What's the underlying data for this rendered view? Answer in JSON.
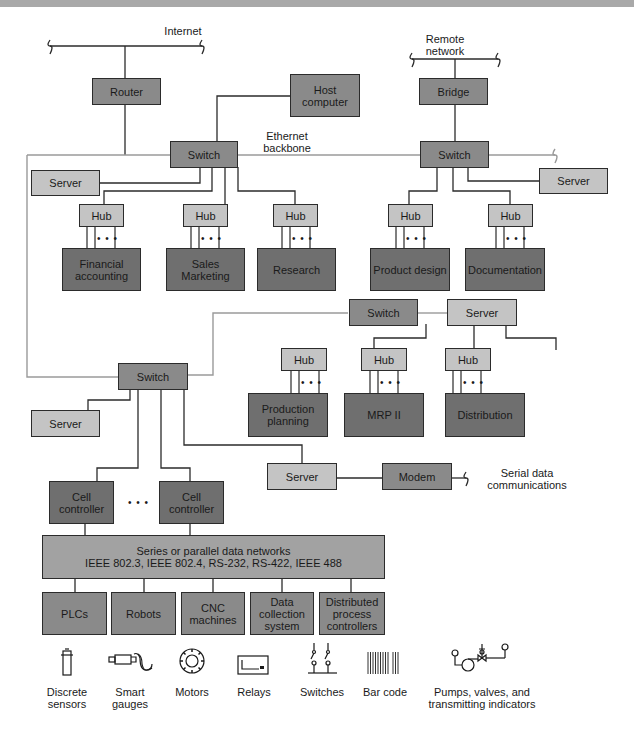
{
  "diagram": {
    "type": "network-topology",
    "external_labels": {
      "internet": "Internet",
      "remote_network": "Remote network",
      "ethernet_backbone": "Ethernet backbone",
      "serial_data": "Serial data communications"
    },
    "nodes": {
      "router": "Router",
      "host_computer": "Host computer",
      "bridge": "Bridge",
      "switch_main": "Switch",
      "switch_right": "Switch",
      "switch_mid": "Switch",
      "switch_factory": "Switch",
      "server_left_top": "Server",
      "server_right_top": "Server",
      "server_mid": "Server",
      "server_factory_left": "Server",
      "server_factory_modem": "Server",
      "modem": "Modem",
      "hub": "Hub",
      "financial_accounting": "Financial accounting",
      "sales_marketing": "Sales Marketing",
      "research": "Research",
      "product_design": "Product design",
      "documentation": "Documentation",
      "production_planning": "Production planning",
      "mrp_ii": "MRP II",
      "distribution": "Distribution",
      "cell_controller": "Cell controller",
      "ellipsis": "• • •",
      "data_networks_line1": "Series or parallel data networks",
      "data_networks_line2": "IEEE 802.3, IEEE 802.4, RS-232, RS-422, IEEE 488",
      "plcs": "PLCs",
      "robots": "Robots",
      "cnc_machines": "CNC machines",
      "data_collection": "Data collection system",
      "distributed_controllers": "Distributed process controllers"
    },
    "devices": [
      {
        "label": "Discrete sensors",
        "icon": "sensor-icon"
      },
      {
        "label": "Smart gauges",
        "icon": "gauge-icon"
      },
      {
        "label": "Motors",
        "icon": "motor-icon"
      },
      {
        "label": "Relays",
        "icon": "relay-icon"
      },
      {
        "label": "Switches",
        "icon": "switch-icon"
      },
      {
        "label": "Bar code",
        "icon": "barcode-icon"
      },
      {
        "label": "Pumps, valves, and transmitting indicators",
        "icon": "pump-valve-icon"
      }
    ],
    "colors": {
      "dark_box": "#8a8a8a",
      "darker_box": "#6f6f6f",
      "light_box": "#c4c4c4",
      "wire": "#2b2b2b",
      "backbone": "#9a9a9a"
    }
  }
}
